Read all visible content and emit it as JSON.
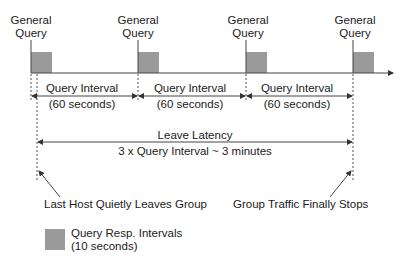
{
  "diagram": {
    "query_labels": [
      {
        "line1": "General",
        "line2": "Query"
      },
      {
        "line1": "General",
        "line2": "Query"
      },
      {
        "line1": "General",
        "line2": "Query"
      },
      {
        "line1": "General",
        "line2": "Query"
      }
    ],
    "intervals": [
      {
        "label": "Query Interval",
        "sub": "(60 seconds)"
      },
      {
        "label": "Query Interval",
        "sub": "(60 seconds)"
      },
      {
        "label": "Query Interval",
        "sub": "(60 seconds)"
      }
    ],
    "leave_latency": {
      "label": "Leave Latency",
      "sub": "3 x Query Interval ~ 3 minutes"
    },
    "annotations": {
      "left": "Last Host Quietly Leaves Group",
      "right": "Group Traffic Finally Stops"
    },
    "legend": {
      "line1": "Query Resp. Intervals",
      "line2": "(10 seconds)"
    },
    "colors": {
      "box": "#9a9a9a",
      "line": "#333333"
    }
  }
}
